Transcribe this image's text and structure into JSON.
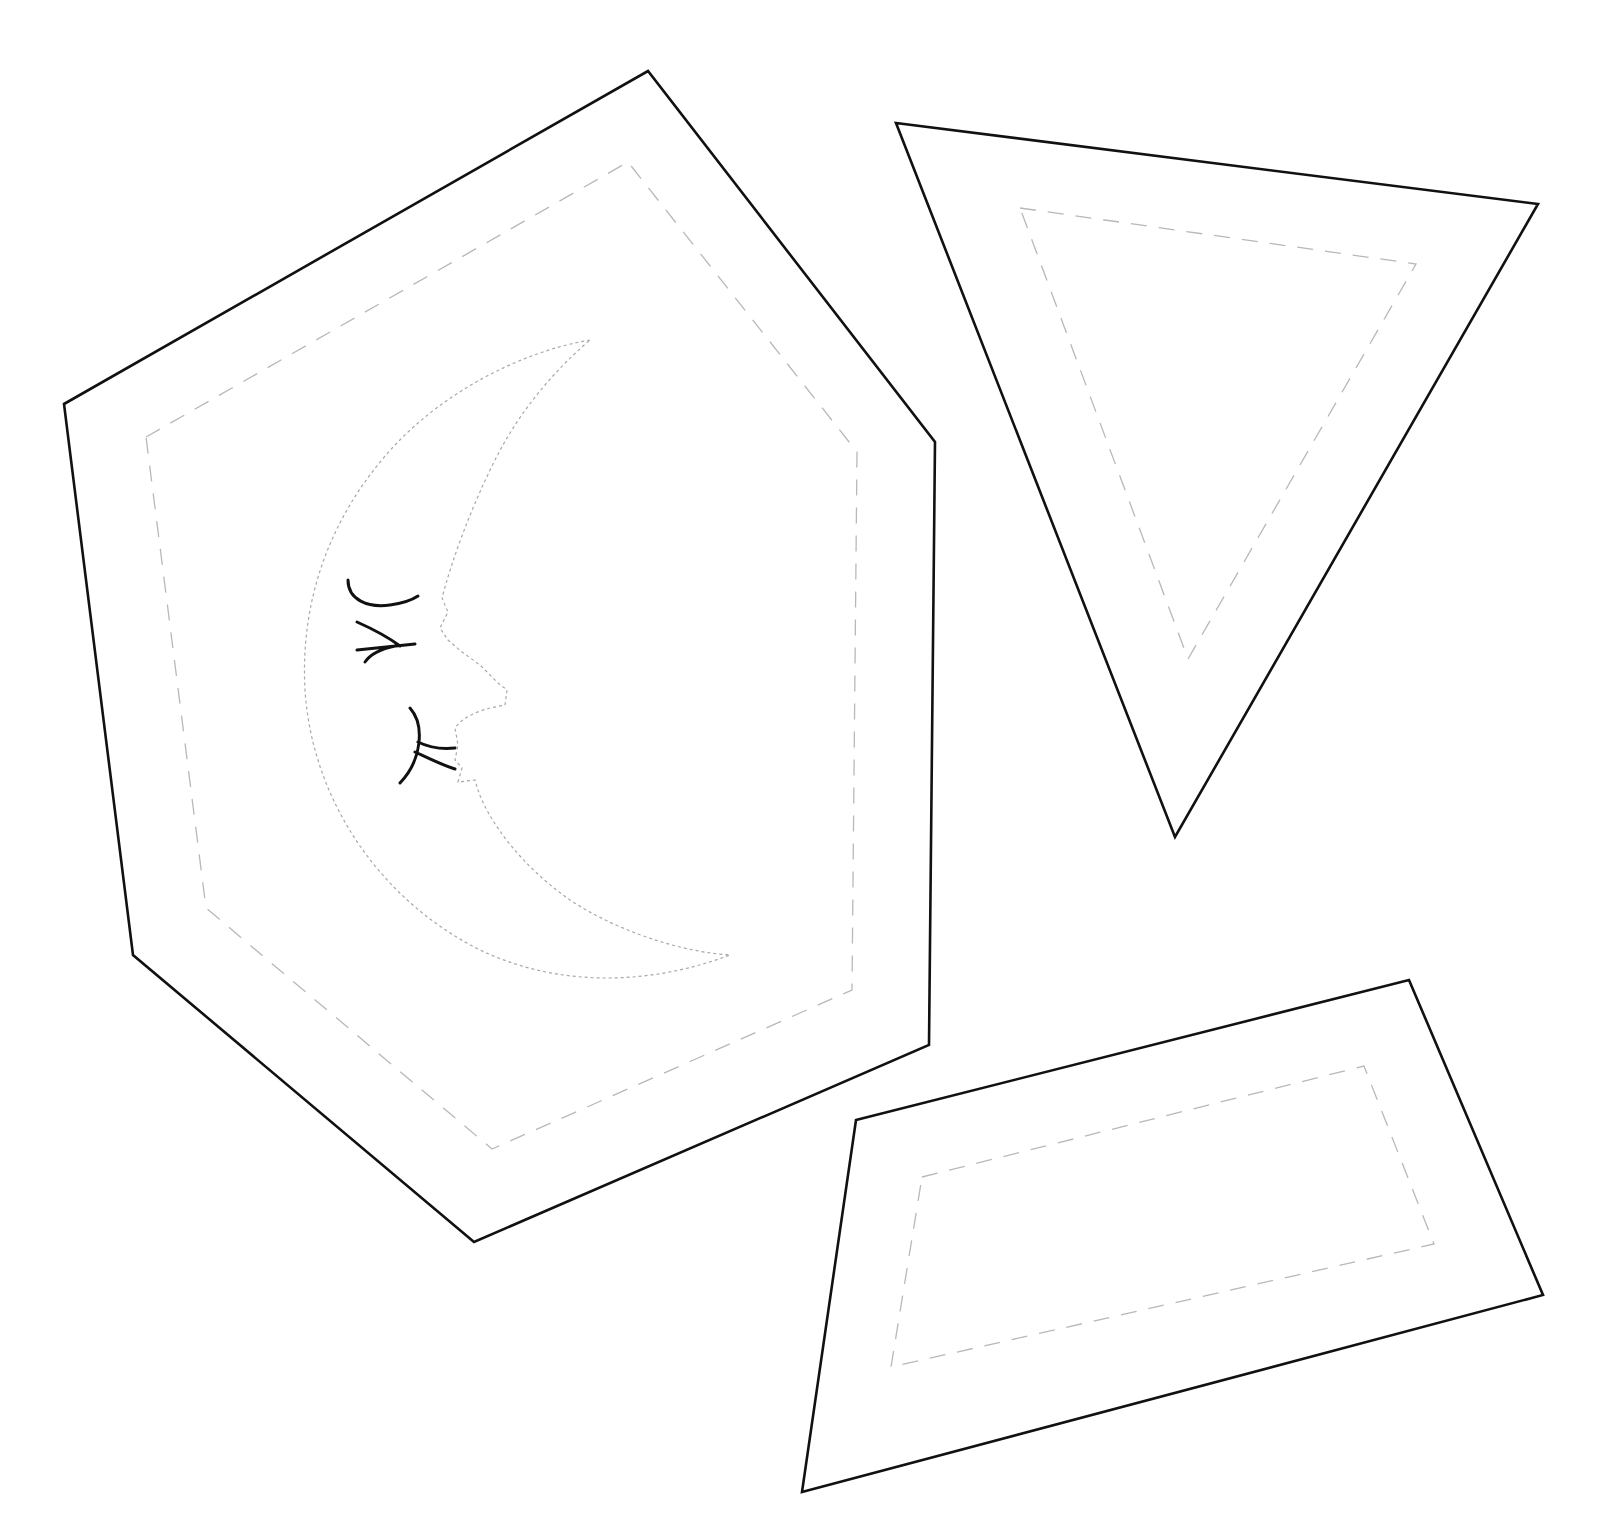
{
  "page": {
    "background": "#ffffff"
  },
  "colors": {
    "cut_line": "#111111",
    "seam_line": "#b8b8b8",
    "applique_line": "#a8a8a8"
  },
  "pieces": [
    {
      "name": "hexagon-piece",
      "cut_points": "64,404 648,71 935,442 929,1045 474,1242 133,955",
      "seam_points": "146,437 628,162 857,452 852,990 492,1149 206,908",
      "applique": "moon-face"
    },
    {
      "name": "triangle-piece",
      "cut_points": "896,123 1538,204 1175,837",
      "seam_points": "1020,208 1416,264 1188,659"
    },
    {
      "name": "trapezoid-piece",
      "cut_points": "856,1120 1409,980 1543,1295 802,1492",
      "seam_points": "922,1177 1364,1066 1434,1244 891,1367"
    }
  ]
}
